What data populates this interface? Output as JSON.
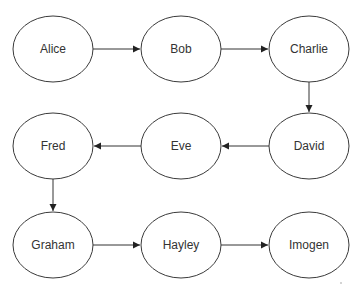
{
  "diagram": {
    "type": "flowchart",
    "colors": {
      "node_stroke": "#3a3a3a",
      "edge": "#333333",
      "text": "#333333",
      "background": "#ffffff"
    },
    "nodes": [
      {
        "id": "alice",
        "label": "Alice"
      },
      {
        "id": "bob",
        "label": "Bob"
      },
      {
        "id": "charlie",
        "label": "Charlie"
      },
      {
        "id": "david",
        "label": "David"
      },
      {
        "id": "eve",
        "label": "Eve"
      },
      {
        "id": "fred",
        "label": "Fred"
      },
      {
        "id": "graham",
        "label": "Graham"
      },
      {
        "id": "hayley",
        "label": "Hayley"
      },
      {
        "id": "imogen",
        "label": "Imogen"
      }
    ],
    "edges": [
      {
        "from": "alice",
        "to": "bob"
      },
      {
        "from": "bob",
        "to": "charlie"
      },
      {
        "from": "charlie",
        "to": "david"
      },
      {
        "from": "david",
        "to": "eve"
      },
      {
        "from": "eve",
        "to": "fred"
      },
      {
        "from": "fred",
        "to": "graham"
      },
      {
        "from": "graham",
        "to": "hayley"
      },
      {
        "from": "hayley",
        "to": "imogen"
      }
    ]
  }
}
